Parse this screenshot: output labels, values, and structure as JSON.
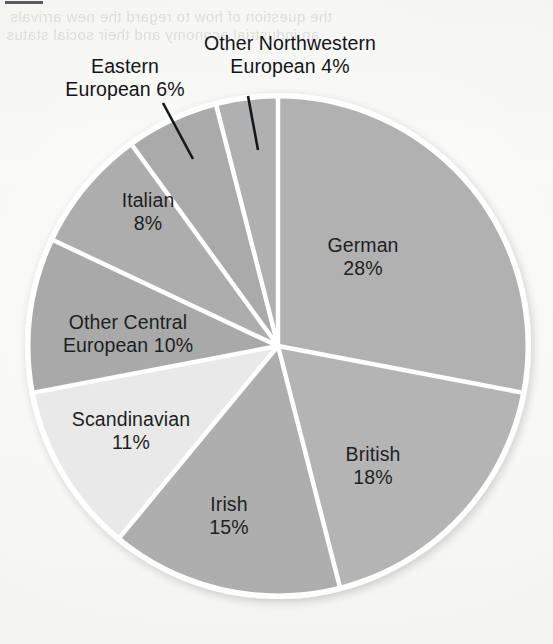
{
  "page": {
    "background_color": "#f7f7f5",
    "bleed_through_text_top": "the question of how to regard the new arrivals",
    "bleed_through_text_second": "an industrial economy and their social status"
  },
  "chart_data": {
    "type": "pie",
    "title": "",
    "subtitle": "",
    "xlabel": "",
    "ylabel": "",
    "legend_position": "none",
    "grid": false,
    "units": "percent",
    "start_angle_deg": 0,
    "direction": "clockwise",
    "categories": [
      "German",
      "British",
      "Irish",
      "Scandinavian",
      "Other Central European",
      "Italian",
      "Eastern European",
      "Other Northwestern European"
    ],
    "values": [
      28,
      18,
      15,
      11,
      10,
      8,
      6,
      4
    ],
    "total": 100,
    "slices": [
      {
        "name": "German",
        "value": 28,
        "label_line1": "German",
        "label_line2": "28%",
        "color": "#b1b1b1",
        "label_placement": "inside",
        "label_x": 363,
        "label_y": 234,
        "leader": false
      },
      {
        "name": "British",
        "value": 18,
        "label_line1": "British",
        "label_line2": "18%",
        "color": "#b4b4b4",
        "label_placement": "inside",
        "label_x": 373,
        "label_y": 443,
        "leader": false
      },
      {
        "name": "Irish",
        "value": 15,
        "label_line1": "Irish",
        "label_line2": "15%",
        "color": "#aeaeae",
        "label_placement": "inside",
        "label_x": 229,
        "label_y": 493,
        "leader": false
      },
      {
        "name": "Scandinavian",
        "value": 11,
        "label_line1": "Scandinavian",
        "label_line2": "11%",
        "color": "#e9e9e9",
        "label_placement": "inside",
        "label_x": 131,
        "label_y": 408,
        "leader": false
      },
      {
        "name": "Other Central European",
        "value": 10,
        "label_line1": "Other Central",
        "label_line2": "European 10%",
        "color": "#a9a9a9",
        "label_placement": "inside",
        "label_x": 128,
        "label_y": 311,
        "leader": false
      },
      {
        "name": "Italian",
        "value": 8,
        "label_line1": "Italian",
        "label_line2": "8%",
        "color": "#adadad",
        "label_placement": "inside",
        "label_x": 148,
        "label_y": 189,
        "leader": false
      },
      {
        "name": "Eastern European",
        "value": 6,
        "label_line1": "Eastern",
        "label_line2": "European 6%",
        "color": "#aaaaaa",
        "label_placement": "outside",
        "label_x": 125,
        "label_y": 55,
        "leader": true,
        "leader_x1": 163,
        "leader_y1": 103,
        "leader_x2": 193,
        "leader_y2": 159
      },
      {
        "name": "Other Northwestern European",
        "value": 4,
        "label_line1": "Other Northwestern",
        "label_line2": "European 4%",
        "color": "#b0b0b0",
        "label_placement": "outside",
        "label_x": 290,
        "label_y": 32,
        "leader": true,
        "leader_x1": 248,
        "leader_y1": 96,
        "leader_x2": 258,
        "leader_y2": 150
      }
    ],
    "geometry": {
      "center_x": 278,
      "center_y": 346,
      "radius": 250,
      "separator_color": "#ffffff",
      "separator_width": 4.5
    }
  }
}
